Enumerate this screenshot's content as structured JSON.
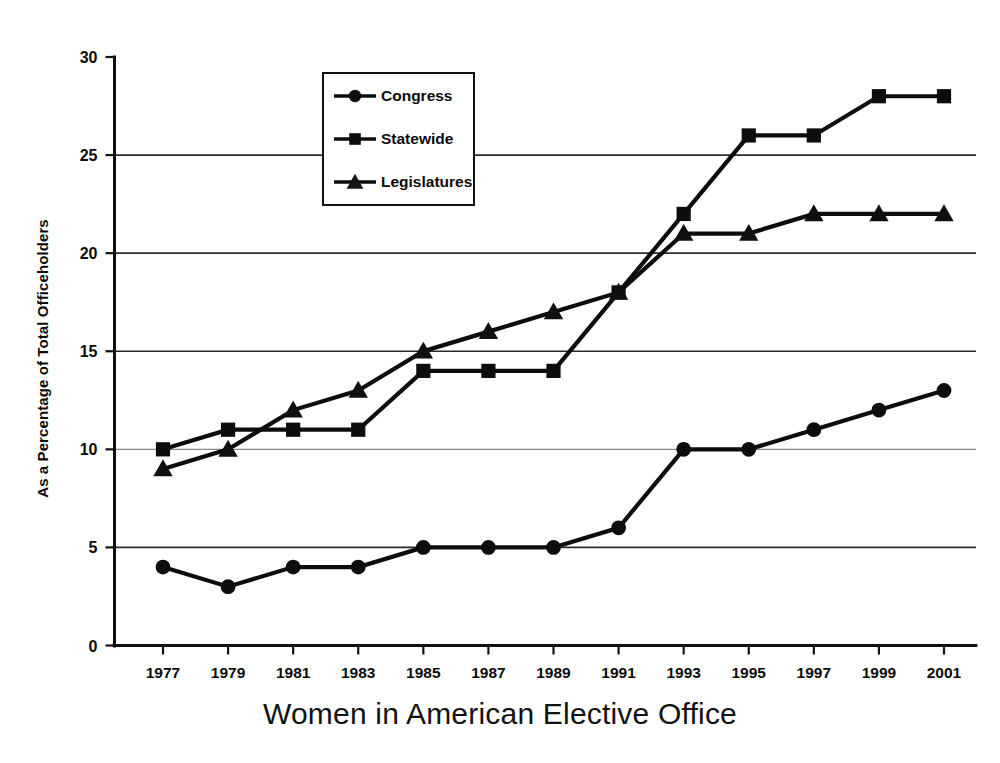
{
  "chart_data": {
    "type": "line",
    "title": "Women in American Elective Office",
    "xlabel": "",
    "ylabel": "As a Percentage of Total Officeholders",
    "xlim": [
      1977,
      2001
    ],
    "ylim": [
      0,
      30
    ],
    "ytick_step": 5,
    "grid": true,
    "legend_position": "top-left-inside",
    "categories": [
      "1977",
      "1979",
      "1981",
      "1983",
      "1985",
      "1987",
      "1989",
      "1991",
      "1993",
      "1995",
      "1997",
      "1999",
      "2001"
    ],
    "x": [
      1977,
      1979,
      1981,
      1983,
      1985,
      1987,
      1989,
      1991,
      1993,
      1995,
      1997,
      1999,
      2001
    ],
    "yticks": [
      "0",
      "5",
      "10",
      "15",
      "20",
      "25",
      "30"
    ],
    "series": [
      {
        "name": "Congress",
        "marker": "circle",
        "color": "#0d0d0d",
        "values": [
          4,
          3,
          4,
          4,
          5,
          5,
          5,
          6,
          10,
          10,
          11,
          12,
          13
        ]
      },
      {
        "name": "Statewide",
        "marker": "square",
        "color": "#0d0d0d",
        "values": [
          10,
          11,
          11,
          11,
          14,
          14,
          14,
          18,
          22,
          26,
          26,
          28,
          28
        ]
      },
      {
        "name": "Legislatures",
        "marker": "triangle",
        "color": "#0d0d0d",
        "values": [
          9,
          10,
          12,
          13,
          15,
          16,
          17,
          18,
          21,
          21,
          22,
          22,
          22
        ]
      }
    ]
  },
  "legend": {
    "items": [
      {
        "label": "Congress",
        "marker": "circle"
      },
      {
        "label": "Statewide",
        "marker": "square"
      },
      {
        "label": "Legislatures",
        "marker": "triangle"
      }
    ]
  },
  "axes": {
    "y_title": "As a Percentage of Total Officeholders"
  },
  "title": "Women in American Elective Office"
}
